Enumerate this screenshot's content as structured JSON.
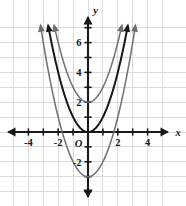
{
  "figure": {
    "background_color": "#ffffff",
    "width": 186,
    "height": 206
  },
  "axes": {
    "x_axis_name": "x",
    "y_axis_name": "y",
    "origin_label": "O",
    "axis_color": "#1a1a1a",
    "grid_color": "#d9d9de",
    "x_tick_labels": [
      "-4",
      "-2",
      "2",
      "4"
    ],
    "y_tick_labels": [
      "6",
      "4",
      "2",
      "-2"
    ]
  },
  "chart_data": {
    "type": "line",
    "title": "",
    "xlabel": "x",
    "ylabel": "y",
    "xlim": [
      -5.2,
      5.2
    ],
    "ylim": [
      -4.2,
      7.4
    ],
    "grid": true,
    "legend": "none",
    "x_ticks": [
      -4,
      -2,
      2,
      4
    ],
    "y_ticks": [
      6,
      4,
      2,
      -2
    ],
    "x_tick_labels": [
      "-4",
      "-2",
      "2",
      "4"
    ],
    "y_tick_labels": [
      "6",
      "4",
      "2",
      "-2"
    ],
    "origin_label": "O",
    "series": [
      {
        "name": "y = x^2 + 2",
        "equation": "y = x^2 + 2",
        "vertex": [
          0,
          2
        ],
        "leading_coefficient": 1,
        "vertical_shift": 2,
        "color": "#6e6e76",
        "stroke_width": 1.5,
        "arrow_ends": "both-up",
        "x": [
          -2.25,
          -2.0,
          -1.75,
          -1.5,
          -1.25,
          -1.0,
          -0.75,
          -0.5,
          -0.25,
          0,
          0.25,
          0.5,
          0.75,
          1.0,
          1.25,
          1.5,
          1.75,
          2.0,
          2.25
        ],
        "values": [
          7.06,
          6.0,
          5.06,
          4.25,
          3.56,
          3.0,
          2.56,
          2.25,
          2.06,
          2.0,
          2.06,
          2.25,
          2.56,
          3.0,
          3.56,
          4.25,
          5.06,
          6.0,
          7.06
        ]
      },
      {
        "name": "y = x^2",
        "equation": "y = x^2",
        "vertex": [
          0,
          0
        ],
        "leading_coefficient": 1,
        "vertical_shift": 0,
        "color": "#18181c",
        "stroke_width": 2.0,
        "arrow_ends": "both-up",
        "x": [
          -2.7,
          -2.5,
          -2.25,
          -2.0,
          -1.75,
          -1.5,
          -1.25,
          -1.0,
          -0.75,
          -0.5,
          -0.25,
          0,
          0.25,
          0.5,
          0.75,
          1.0,
          1.25,
          1.5,
          1.75,
          2.0,
          2.25,
          2.5,
          2.7
        ],
        "values": [
          7.29,
          6.25,
          5.06,
          4.0,
          3.06,
          2.25,
          1.56,
          1.0,
          0.56,
          0.25,
          0.06,
          0,
          0.06,
          0.25,
          0.56,
          1.0,
          1.56,
          2.25,
          3.06,
          4.0,
          5.06,
          6.25,
          7.29
        ]
      },
      {
        "name": "y = x^2 - 3",
        "equation": "y = x^2 - 3",
        "vertex": [
          0,
          -3
        ],
        "leading_coefficient": 1,
        "vertical_shift": -3,
        "color": "#6e6e76",
        "stroke_width": 1.5,
        "arrow_ends": "both-up",
        "x": [
          -3.2,
          -3.0,
          -2.75,
          -2.5,
          -2.25,
          -2.0,
          -1.75,
          -1.5,
          -1.25,
          -1.0,
          -0.75,
          -0.5,
          -0.25,
          0,
          0.25,
          0.5,
          0.75,
          1.0,
          1.25,
          1.5,
          1.75,
          2.0,
          2.25,
          2.5,
          2.75,
          3.0,
          3.2
        ],
        "values": [
          7.24,
          6.0,
          4.56,
          3.25,
          2.06,
          1.0,
          0.06,
          -0.75,
          -1.44,
          -2.0,
          -2.44,
          -2.75,
          -2.94,
          -3.0,
          -2.94,
          -2.75,
          -2.44,
          -2.0,
          -1.44,
          -0.75,
          0.06,
          1.0,
          2.06,
          3.25,
          4.56,
          6.0,
          7.24
        ]
      }
    ]
  }
}
